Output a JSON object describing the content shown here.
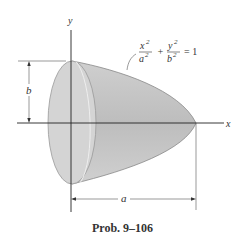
{
  "figure": {
    "caption": "Prob. 9–106",
    "axes": {
      "x_label": "x",
      "y_label": "y"
    },
    "equation": {
      "x_num": "x",
      "x_den": "a",
      "y_num": "y",
      "y_den": "b",
      "exp": "2",
      "plus": "+",
      "rhs": "= 1"
    },
    "dimensions": {
      "height_label": "b",
      "length_label": "a"
    },
    "colors": {
      "solid_fill": "#c6c6c6",
      "face_fill": "#d2d2d2",
      "line": "#333333"
    }
  }
}
